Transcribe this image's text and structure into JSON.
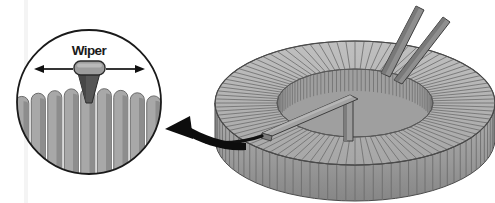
{
  "figure": {
    "background_color": "#ffffff"
  },
  "detail_circle": {
    "name": "magnified wiper detail",
    "center_x": 89,
    "center_y": 102,
    "radius": 72,
    "outline_color": "#1a1a1a",
    "fill_color": "#ffffff",
    "label": "Wiper",
    "label_x": 89,
    "label_y": 54,
    "arrow_left": {
      "icon": "arrow-left-icon",
      "from_x": 75,
      "to_x": 36,
      "y": 69
    },
    "arrow_right": {
      "icon": "arrow-right-icon",
      "from_x": 103,
      "to_x": 142,
      "y": 69
    },
    "wiper_cap": {
      "x": 74,
      "y": 62,
      "width": 30,
      "height": 13,
      "radius": 6,
      "fill": "#9a9a9a",
      "stroke": "#2b2b2b"
    },
    "wiper_stem": {
      "fill": "#565656",
      "stroke": "#2b2b2b",
      "top_width": 22,
      "tip_width": 5,
      "top_y": 74,
      "tip_y": 103
    },
    "windings": {
      "count": 9,
      "fill_light": "#a8a8a8",
      "fill_shade": "#8d8d8d",
      "separator": "#6b6b6b",
      "top_y": 88,
      "bar_pitch": 16.5
    }
  },
  "toroid": {
    "name": "toroidal coil winding",
    "center_x": 355,
    "center_y": 103,
    "outer_rx": 140,
    "outer_ry": 62,
    "inner_rx": 78,
    "inner_ry": 34,
    "body_height": 36,
    "segment_count": 96,
    "fill_top": "#b4b4b4",
    "fill_side_light": "#aaaaaa",
    "fill_side_dark": "#8a8a8a",
    "separator": "#707070",
    "outline": "#4a4a4a",
    "hole_fill": "#ffffff"
  },
  "wiper_arm": {
    "name": "rotating wiper arm",
    "fill": "#9c9c9c",
    "fill_dark": "#7a7a7a",
    "stroke": "#3d3d3d",
    "hub_x": 349,
    "hub_top_y": 98,
    "hub_bottom_y": 139,
    "contact_x": 266,
    "contact_y": 131
  },
  "terminals": [
    {
      "name": "terminal-lead-1",
      "base_x": 386,
      "base_y": 71,
      "tip_x": 421,
      "tip_y": 8,
      "fill": "#8f8f8f",
      "stroke": "#3d3d3d"
    },
    {
      "name": "terminal-lead-2",
      "base_x": 399,
      "base_y": 76,
      "tip_x": 447,
      "tip_y": 20,
      "fill": "#8f8f8f",
      "stroke": "#3d3d3d"
    }
  ],
  "lead_wire": {
    "name": "wiper-lead-wire",
    "color": "#111111",
    "start_x": 208,
    "start_y": 141,
    "end_x": 266,
    "end_y": 133
  },
  "callout_arrow": {
    "name": "magnification-callout-arrow",
    "icon": "curved-arrow-left-icon",
    "color": "#0d0d0d",
    "tail_x": 244,
    "tail_y": 147,
    "head_x": 166,
    "head_y": 128
  },
  "scan_artifact": {
    "x": 26,
    "color": "#f2f2f2"
  }
}
